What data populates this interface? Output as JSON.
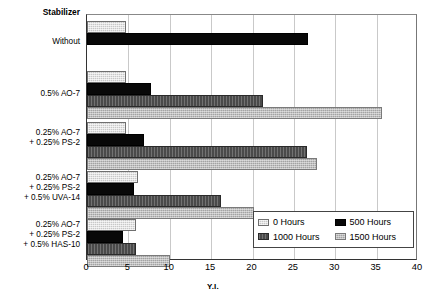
{
  "chart_data": {
    "type": "bar",
    "orientation": "horizontal",
    "title": "",
    "xlabel": "Y.I.",
    "ylabel": "Stabilizer",
    "xlim": [
      0,
      40
    ],
    "xticks": [
      0,
      5,
      10,
      15,
      20,
      25,
      30,
      35,
      40
    ],
    "grid": true,
    "legend_position": "inside-lower-right",
    "categories": [
      "Without",
      "0.5% AO-7",
      "0.25% AO-7\n+ 0.25% PS-2",
      "0.25% AO-7\n+ 0.25% PS-2\n+ 0.5% UVA-14",
      "0.25% AO-7\n+ 0.25% PS-2\n+ 0.5% HAS-10"
    ],
    "category_lines": [
      [
        "Without"
      ],
      [
        "0.5% AO-7"
      ],
      [
        "0.25% AO-7",
        "+ 0.25% PS-2"
      ],
      [
        "0.25% AO-7",
        "+ 0.25% PS-2",
        "+ 0.5% UVA-14"
      ],
      [
        "0.25% AO-7",
        "+ 0.25% PS-2",
        "+ 0.5% HAS-10"
      ]
    ],
    "series": [
      {
        "name": "0 Hours",
        "color": "#c8c8c8",
        "values": [
          4.7,
          4.7,
          4.7,
          6.2,
          5.9
        ]
      },
      {
        "name": "500 Hours",
        "color": "#080808",
        "values": [
          26.7,
          7.7,
          6.9,
          5.7,
          4.3
        ]
      },
      {
        "name": "1000 Hours",
        "color": "#4a4a4a",
        "values": [
          null,
          21.3,
          26.6,
          16.2,
          5.9
        ]
      },
      {
        "name": "1500 Hours",
        "color": "#a3a3a3",
        "values": [
          null,
          35.7,
          27.8,
          20.2,
          10.0
        ]
      }
    ]
  },
  "axis": {
    "header_label": "Stabilizer",
    "x_title": "Y.I.",
    "tick_labels": [
      "0",
      "5",
      "10",
      "15",
      "20",
      "25",
      "30",
      "35",
      "40"
    ]
  },
  "legend": {
    "items": [
      {
        "label": "0 Hours",
        "swatch": "swatch-0-hours"
      },
      {
        "label": "500 Hours",
        "swatch": "swatch-500-hours"
      },
      {
        "label": "1000 Hours",
        "swatch": "swatch-1000-hours"
      },
      {
        "label": "1500 Hours",
        "swatch": "swatch-1500-hours"
      }
    ]
  }
}
